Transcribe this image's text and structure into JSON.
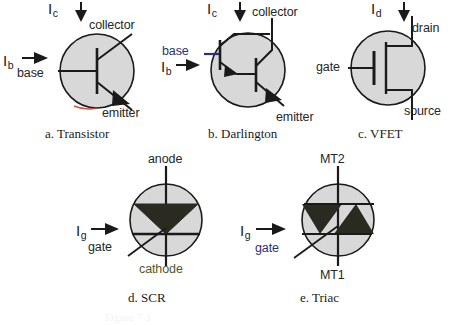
{
  "page": {
    "background": "#ffffff",
    "body_fill": "#d8d8d8",
    "stroke": "#1a1a1a",
    "blue": "#2b2f80",
    "green": "#4d5a2a",
    "red": "#c0392b",
    "bottom_note": "Figure 7-1"
  },
  "figures": [
    {
      "id": "transistor",
      "caption": "a. Transistor",
      "current_in": {
        "symbol": "I",
        "subscript": "b"
      },
      "current_out": {
        "symbol": "I",
        "subscript": "c"
      },
      "terminals": [
        {
          "name": "base",
          "color": "dark"
        },
        {
          "name": "collector",
          "color": "dark"
        },
        {
          "name": "emitter",
          "color": "dark"
        }
      ]
    },
    {
      "id": "darlington",
      "caption": "b. Darlington",
      "current_in": {
        "symbol": "I",
        "subscript": "b"
      },
      "current_out": {
        "symbol": "I",
        "subscript": "c"
      },
      "terminals": [
        {
          "name": "base",
          "color": "blue"
        },
        {
          "name": "collector",
          "color": "dark"
        },
        {
          "name": "emitter",
          "color": "dark"
        }
      ]
    },
    {
      "id": "vfet",
      "caption": "c. VFET",
      "current_out": {
        "symbol": "I",
        "subscript": "d"
      },
      "terminals": [
        {
          "name": "gate",
          "color": "dark"
        },
        {
          "name": "drain",
          "color": "dark"
        },
        {
          "name": "source",
          "color": "dark"
        }
      ]
    },
    {
      "id": "scr",
      "caption": "d. SCR",
      "current_in": {
        "symbol": "I",
        "subscript": "g"
      },
      "terminals": [
        {
          "name": "anode",
          "color": "dark"
        },
        {
          "name": "gate",
          "color": "dark"
        },
        {
          "name": "cathode",
          "color": "green"
        }
      ]
    },
    {
      "id": "triac",
      "caption": "e. Triac",
      "current_in": {
        "symbol": "I",
        "subscript": "g"
      },
      "terminals": [
        {
          "name": "MT2",
          "color": "dark"
        },
        {
          "name": "gate",
          "color": "blue"
        },
        {
          "name": "MT1",
          "color": "dark"
        }
      ]
    }
  ]
}
